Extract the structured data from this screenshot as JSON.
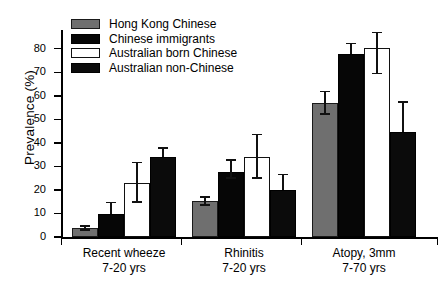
{
  "chart_data": {
    "type": "bar",
    "title": "",
    "xlabel": "",
    "ylabel": "Prevalence (%)",
    "ylim": [
      0,
      85
    ],
    "yticks": [
      0,
      10,
      20,
      30,
      40,
      50,
      60,
      70,
      80
    ],
    "ytick_labels": [
      "0",
      "10",
      "20",
      "30",
      "40",
      "50",
      "60",
      "70",
      "80"
    ],
    "grid": false,
    "legend_position": "top-left",
    "categories": [
      "Recent wheeze\n7-20 yrs",
      "Rhinitis\n7-20 yrs",
      "Atopy, 3mm\n7-70 yrs"
    ],
    "category_lines": [
      {
        "line1": "Recent wheeze",
        "line2": "7-20 yrs"
      },
      {
        "line1": "Rhinitis",
        "line2": "7-20 yrs"
      },
      {
        "line1": "Atopy, 3mm",
        "line2": "7-70 yrs"
      }
    ],
    "series": [
      {
        "name": "Hong Kong Chinese",
        "key": "hk",
        "color": "#6f6f6f",
        "values": [
          3.7,
          15.3,
          57.0
        ],
        "err_low": [
          1.0,
          2.0,
          5.0
        ],
        "err_high": [
          1.2,
          2.0,
          5.0
        ]
      },
      {
        "name": "Chinese immigrants",
        "key": "imm",
        "color": "#060606",
        "values": [
          9.7,
          27.8,
          77.8
        ],
        "err_low": [
          0.0,
          3.0,
          0.0
        ],
        "err_high": [
          5.3,
          5.2,
          4.7
        ]
      },
      {
        "name": "Australian born Chinese",
        "key": "aus-born",
        "color": "#ffffff",
        "values": [
          23.0,
          34.2,
          80.2
        ],
        "err_low": [
          8.4,
          9.4,
          11.0
        ],
        "err_high": [
          9.0,
          9.6,
          7.0
        ]
      },
      {
        "name": "Australian non-Chinese",
        "key": "aus-non",
        "color": "#0b0b0b",
        "values": [
          33.8,
          19.8,
          44.5
        ],
        "err_low": [
          0.0,
          0.0,
          0.0
        ],
        "err_high": [
          4.3,
          7.0,
          13.2
        ]
      }
    ]
  },
  "legend": {
    "items": [
      {
        "label": "Hong Kong Chinese",
        "swatch": "hk"
      },
      {
        "label": "Chinese immigrants",
        "swatch": "imm"
      },
      {
        "label": "Australian born Chinese",
        "swatch": "aus-born"
      },
      {
        "label": "Australian non-Chinese",
        "swatch": "aus-non"
      }
    ]
  }
}
